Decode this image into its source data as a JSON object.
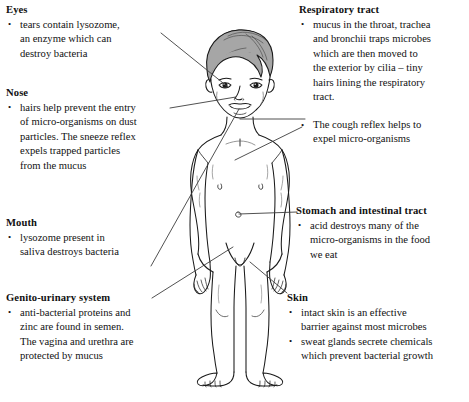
{
  "diagram": {
    "figure": {
      "name": "child-body-outline",
      "description": "Front-facing line drawing of a child standing with arms at sides",
      "style": "black ink line drawing with grey shaded hair"
    },
    "colors": {
      "ink": "#1a1a1a",
      "leader_line": "#4a4a4a",
      "hair_shade": "#9a9a9a",
      "background": "#ffffff"
    }
  },
  "callouts": {
    "eyes": {
      "heading": "Eyes",
      "bullets": [
        "tears contain lysozome, an enzyme which can destroy bacteria"
      ],
      "lines": [
        [
          "tears contain lysozome,",
          "an enzyme which can",
          "destroy bacteria"
        ]
      ]
    },
    "nose": {
      "heading": "Nose",
      "bullets": [
        "hairs help prevent the entry of micro-organisms on dust particles. The sneeze reflex expels trapped particles from the mucus"
      ],
      "lines": [
        [
          "hairs help prevent the entry",
          "of micro-organisms on dust",
          "particles. The sneeze reflex",
          "expels trapped particles",
          "from the mucus"
        ]
      ]
    },
    "mouth": {
      "heading": "Mouth",
      "bullets": [
        "lysozome present in saliva destroys bacteria"
      ],
      "lines": [
        [
          "lysozome present in",
          "saliva destroys bacteria"
        ]
      ]
    },
    "genito_urinary": {
      "heading": "Genito-urinary system",
      "bullets": [
        "anti-bacterial proteins and zinc are found in semen. The vagina and urethra are protected by mucus"
      ],
      "lines": [
        [
          "anti-bacterial proteins and",
          "zinc are found in semen.",
          "The vagina and urethra are",
          "protected by mucus"
        ]
      ]
    },
    "respiratory_tract": {
      "heading": "Respiratory tract",
      "bullets": [
        "mucus in the throat, trachea and bronchii traps microbes which are then moved to the exterior by cilia – tiny hairs lining the respiratory tract.",
        "The cough reflex helps to expel micro-organisms"
      ],
      "lines": [
        [
          "mucus in the throat, trachea",
          "and bronchii traps microbes",
          "which are then moved to",
          "the exterior by cilia – tiny",
          "hairs lining the respiratory",
          "tract."
        ],
        [
          "The cough reflex helps to",
          "expel micro-organisms"
        ]
      ]
    },
    "stomach_intestinal_tract": {
      "heading": "Stomach and intestinal tract",
      "bullets": [
        "acid destroys many of the micro-organisms in the food we eat"
      ],
      "lines": [
        [
          "acid destroys many of the",
          "micro-organisms in the food",
          "we eat"
        ]
      ]
    },
    "skin": {
      "heading": "Skin",
      "bullets": [
        "intact skin is an effective barrier against most microbes",
        "sweat glands secrete chemicals which prevent bacterial growth"
      ],
      "lines": [
        [
          "intact skin is an effective",
          "barrier against most microbes"
        ],
        [
          "sweat glands secrete chemicals",
          "which prevent bacterial growth"
        ]
      ]
    }
  }
}
